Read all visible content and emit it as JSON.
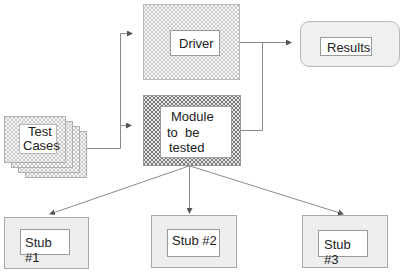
{
  "diagram": {
    "type": "unit-testing-environment",
    "nodes": {
      "driver": {
        "label": "Driver",
        "fill": "dotted-pattern"
      },
      "module": {
        "label_lines": [
          "Module",
          "to  be",
          "tested"
        ],
        "fill": "crosshatch-pattern"
      },
      "results": {
        "label": "Results",
        "shape": "rounded-rectangle"
      },
      "test_cases": {
        "label_lines": [
          "Test",
          "Cases"
        ],
        "shape": "stacked-cards",
        "card_count": 4
      },
      "stub1": {
        "label": "Stub #1"
      },
      "stub2": {
        "label": "Stub #2"
      },
      "stub3": {
        "label": "Stub #3"
      }
    },
    "edges": [
      {
        "from": "test_cases",
        "to": "driver"
      },
      {
        "from": "test_cases",
        "to": "module"
      },
      {
        "from": "driver",
        "to": "results"
      },
      {
        "from": "module",
        "to": "results"
      },
      {
        "from": "module",
        "to": "stub1"
      },
      {
        "from": "module",
        "to": "stub2"
      },
      {
        "from": "module",
        "to": "stub3"
      }
    ],
    "colors": {
      "line": "#8a8a8a",
      "box_fill": "#eeeeee",
      "box_border": "#a0a0a0",
      "pattern_dark": "#7a7a7a"
    }
  }
}
